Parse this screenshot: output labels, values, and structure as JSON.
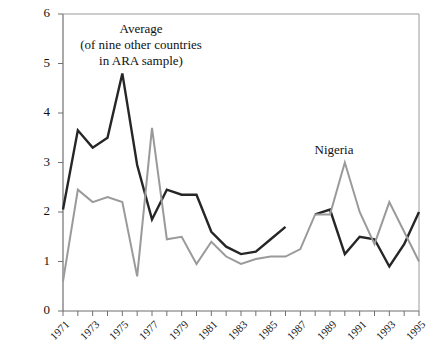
{
  "chart_data": {
    "type": "line",
    "title": "",
    "xlabel": "",
    "ylabel": "",
    "xlim": [
      1971,
      1995
    ],
    "ylim": [
      0,
      6
    ],
    "grid": false,
    "legend_position": "inline-annotations",
    "yticks": [
      0,
      1,
      2,
      3,
      4,
      5,
      6
    ],
    "ytick_labels": [
      "0",
      "1",
      "2",
      "3",
      "4",
      "5",
      "6"
    ],
    "xticks": [
      1971,
      1972,
      1973,
      1974,
      1975,
      1976,
      1977,
      1978,
      1979,
      1980,
      1981,
      1982,
      1983,
      1984,
      1985,
      1986,
      1987,
      1988,
      1989,
      1990,
      1991,
      1992,
      1993,
      1994,
      1995
    ],
    "xtick_labels": [
      "1971",
      "",
      "1973",
      "",
      "1975",
      "",
      "1977",
      "",
      "1979",
      "",
      "1981",
      "",
      "1983",
      "",
      "1985",
      "",
      "1987",
      "",
      "1989",
      "",
      "1991",
      "",
      "1993",
      "",
      "1995"
    ],
    "x": [
      1971,
      1972,
      1973,
      1974,
      1975,
      1976,
      1977,
      1978,
      1979,
      1980,
      1981,
      1982,
      1983,
      1984,
      1985,
      1986,
      1987,
      1988,
      1989,
      1990,
      1991,
      1992,
      1993,
      1994,
      1995
    ],
    "series": [
      {
        "name": "Average (of nine other countries in ARA sample)",
        "color": "#262626",
        "values": [
          2.05,
          3.65,
          3.3,
          3.5,
          4.8,
          2.95,
          1.85,
          2.45,
          2.35,
          2.35,
          1.6,
          1.3,
          1.15,
          1.2,
          1.45,
          1.7,
          null,
          1.95,
          2.05,
          1.15,
          1.5,
          1.45,
          0.9,
          1.35,
          2.0
        ]
      },
      {
        "name": "Nigeria",
        "color": "#9a9a9a",
        "values": [
          0.6,
          2.45,
          2.2,
          2.3,
          2.2,
          0.7,
          3.7,
          1.45,
          1.5,
          0.95,
          1.4,
          1.1,
          0.95,
          1.05,
          1.1,
          1.1,
          1.25,
          1.95,
          1.95,
          3.0,
          2.0,
          1.35,
          2.2,
          1.6,
          1.0
        ]
      }
    ],
    "annotations": [
      {
        "name": "average-annotation",
        "lines": [
          "Average",
          "(of nine other countries",
          "in ARA sample)"
        ],
        "x": 1974,
        "y": 5.5
      },
      {
        "name": "nigeria-annotation",
        "lines": [
          "Nigeria"
        ],
        "x": 1988,
        "y": 3.05
      }
    ],
    "notes": {
      "black_series_gap_year": 1987,
      "axis_style": "left and bottom spines with outward ticks, thin top and right border"
    }
  }
}
